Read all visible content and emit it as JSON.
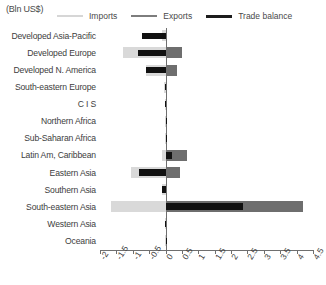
{
  "units_label": "(Bln US$)",
  "legend": {
    "items": [
      {
        "label": "Imports",
        "color": "#d9d9d9",
        "name": "imports"
      },
      {
        "label": "Exports",
        "color": "#6e6e6e",
        "name": "exports"
      },
      {
        "label": "Trade balance",
        "color": "#111111",
        "name": "trade-balance"
      }
    ]
  },
  "chart_data": {
    "type": "bar",
    "orientation": "horizontal",
    "title": "",
    "subtitle": "",
    "xlabel": "(Bln US$)",
    "ylabel": "",
    "xlim": [
      -2,
      4.5
    ],
    "xticks": [
      -2,
      -1.5,
      -1,
      -0.5,
      0,
      0.5,
      1,
      1.5,
      2,
      2.5,
      3,
      3.5,
      4,
      4.5
    ],
    "xticklabels": [
      "-2",
      "-1.5",
      "-1",
      "-0.5",
      "0",
      "0.5",
      "1",
      "1.5",
      "2",
      "2.5",
      "3",
      "3.5",
      "4",
      "4.5"
    ],
    "grid": false,
    "legend_position": "top",
    "categories": [
      "Developed Asia-Pacific",
      "Developed Europe",
      "Developed N. America",
      "South-eastern Europe",
      "C I S",
      "Northern Africa",
      "Sub-Saharan Africa",
      "Latin Am, Caribbean",
      "Eastern Asia",
      "Southern Asia",
      "South-eastern Asia",
      "Western Asia",
      "Oceania"
    ],
    "series": [
      {
        "name": "Imports",
        "color": "#d9d9d9",
        "values": [
          -0.12,
          -1.3,
          -0.6,
          -0.04,
          -0.02,
          -0.01,
          -0.01,
          -0.1,
          -1.05,
          -0.1,
          -1.65,
          -0.03,
          -0.01
        ]
      },
      {
        "name": "Exports",
        "color": "#6e6e6e",
        "values": [
          0.03,
          0.5,
          0.35,
          0.02,
          0.01,
          0.01,
          0.01,
          0.65,
          0.45,
          0.05,
          4.2,
          0.03,
          0.01
        ]
      },
      {
        "name": "Trade balance",
        "color": "#111111",
        "values": [
          -0.72,
          -0.85,
          -0.6,
          -0.02,
          -0.01,
          0.0,
          0.0,
          0.2,
          -0.8,
          -0.12,
          2.35,
          -0.02,
          0.0
        ]
      }
    ]
  }
}
